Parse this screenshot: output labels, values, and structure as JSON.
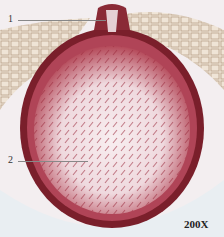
{
  "figure": {
    "type": "micrograph",
    "labels": [
      {
        "id": "1",
        "text": "1"
      },
      {
        "id": "2",
        "text": "2"
      }
    ],
    "magnification": "200X",
    "colors": {
      "background": "#f3eef0",
      "tissue_dark": "#6b1a22",
      "tissue_mid": "#a8394a",
      "tissue_light": "#e7c9cf",
      "outer_layer": "#c9b59a"
    }
  }
}
